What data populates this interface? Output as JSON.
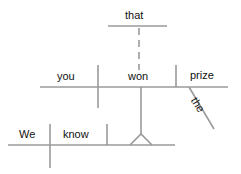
{
  "diagram": {
    "type": "sentence-diagram",
    "sentence": "We know that you won the prize",
    "line_color": "#9a9a9a",
    "text_color": "#111111",
    "words": {
      "clause_marker": "that",
      "sub_subject": "you",
      "sub_verb": "won",
      "sub_object": "prize",
      "modifier": "the",
      "main_subject": "We",
      "main_verb": "know"
    }
  }
}
